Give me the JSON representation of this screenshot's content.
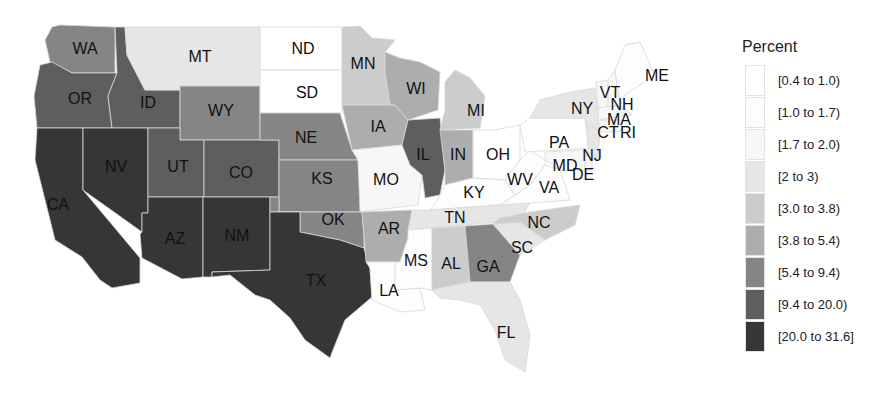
{
  "legend": {
    "title": "Percent",
    "bins": [
      {
        "label": "[0.4 to 1.0)",
        "color": "#ffffff"
      },
      {
        "label": "[1.0 to 1.7)",
        "color": "#fdfdfd"
      },
      {
        "label": "[1.7 to 2.0)",
        "color": "#f7f7f7"
      },
      {
        "label": "[2 to 3)",
        "color": "#e6e6e6"
      },
      {
        "label": "[3.0 to 3.8)",
        "color": "#cccccc"
      },
      {
        "label": "[3.8 to 5.4)",
        "color": "#adadad"
      },
      {
        "label": "[5.4 to 9.4)",
        "color": "#858585"
      },
      {
        "label": "[9.4 to 20.0)",
        "color": "#5e5e5e"
      },
      {
        "label": "[20.0 to 31.6]",
        "color": "#363636"
      }
    ]
  },
  "states": [
    {
      "abbr": "WA",
      "bin": 6
    },
    {
      "abbr": "OR",
      "bin": 7
    },
    {
      "abbr": "CA",
      "bin": 8
    },
    {
      "abbr": "ID",
      "bin": 7
    },
    {
      "abbr": "NV",
      "bin": 8
    },
    {
      "abbr": "MT",
      "bin": 3
    },
    {
      "abbr": "WY",
      "bin": 6
    },
    {
      "abbr": "UT",
      "bin": 7
    },
    {
      "abbr": "CO",
      "bin": 7
    },
    {
      "abbr": "AZ",
      "bin": 8
    },
    {
      "abbr": "NM",
      "bin": 8
    },
    {
      "abbr": "ND",
      "bin": 0
    },
    {
      "abbr": "SD",
      "bin": 0
    },
    {
      "abbr": "NE",
      "bin": 6
    },
    {
      "abbr": "KS",
      "bin": 6
    },
    {
      "abbr": "OK",
      "bin": 6
    },
    {
      "abbr": "TX",
      "bin": 8
    },
    {
      "abbr": "MN",
      "bin": 4
    },
    {
      "abbr": "IA",
      "bin": 5
    },
    {
      "abbr": "MO",
      "bin": 2
    },
    {
      "abbr": "AR",
      "bin": 5
    },
    {
      "abbr": "LA",
      "bin": 1
    },
    {
      "abbr": "WI",
      "bin": 5
    },
    {
      "abbr": "IL",
      "bin": 7
    },
    {
      "abbr": "MI",
      "bin": 4
    },
    {
      "abbr": "IN",
      "bin": 5
    },
    {
      "abbr": "OH",
      "bin": 0
    },
    {
      "abbr": "KY",
      "bin": 1
    },
    {
      "abbr": "TN",
      "bin": 3
    },
    {
      "abbr": "MS",
      "bin": 1
    },
    {
      "abbr": "AL",
      "bin": 4
    },
    {
      "abbr": "GA",
      "bin": 6
    },
    {
      "abbr": "FL",
      "bin": 3
    },
    {
      "abbr": "SC",
      "bin": 3
    },
    {
      "abbr": "NC",
      "bin": 4
    },
    {
      "abbr": "VA",
      "bin": 1
    },
    {
      "abbr": "WV",
      "bin": 1
    },
    {
      "abbr": "PA",
      "bin": 0
    },
    {
      "abbr": "NY",
      "bin": 3
    },
    {
      "abbr": "NJ",
      "bin": 3
    },
    {
      "abbr": "DE",
      "bin": 2
    },
    {
      "abbr": "MD",
      "bin": 2
    },
    {
      "abbr": "VT",
      "bin": 2
    },
    {
      "abbr": "NH",
      "bin": 2
    },
    {
      "abbr": "ME",
      "bin": 1
    },
    {
      "abbr": "MA",
      "bin": 2
    },
    {
      "abbr": "CT",
      "bin": 2
    },
    {
      "abbr": "RI",
      "bin": 2
    }
  ]
}
